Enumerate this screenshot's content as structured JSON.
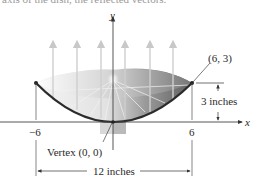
{
  "cutoff_text": "axis of the dish, the reflected vectors.",
  "axes": {
    "x_label": "x",
    "y_label": "y"
  },
  "ticks": {
    "left": "−6",
    "right": "6"
  },
  "labels": {
    "point": "(6, 3)",
    "depth": "3 inches",
    "vertex": "Vertex (0, 0)",
    "width": "12 inches"
  },
  "diagram": {
    "type": "parabolic-reflector",
    "equation_points": [
      [
        -6,
        3
      ],
      [
        0,
        0
      ],
      [
        6,
        3
      ]
    ],
    "vertex": [
      0,
      0
    ],
    "dish_depth_in": 3,
    "dish_width_in": 12,
    "reflected_rays": 7,
    "colors": {
      "curve": "#2b2b2b",
      "dish_dark": "#6e6e6e",
      "dish_light": "#e8e8e8",
      "rays": "#cfcfcf",
      "axis": "#333333"
    }
  }
}
